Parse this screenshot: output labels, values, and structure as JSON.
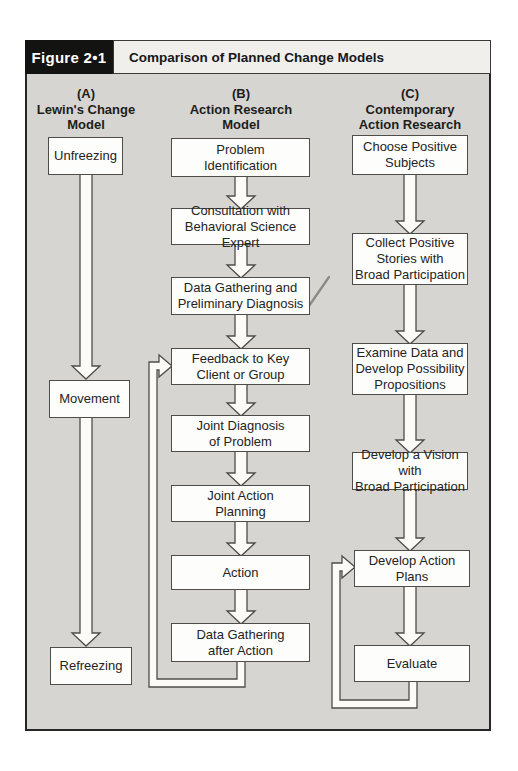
{
  "figure": {
    "label": "Figure 2•1",
    "title": "Comparison of Planned Change Models"
  },
  "columns": {
    "a": {
      "heading": "(A)\nLewin's Change\nModel",
      "boxes": {
        "unfreezing": "Unfreezing",
        "movement": "Movement",
        "refreezing": "Refreezing"
      }
    },
    "b": {
      "heading": "(B)\nAction Research\nModel",
      "boxes": {
        "problem_identification": "Problem\nIdentification",
        "consultation": "Consultation with\nBehavioral Science Expert",
        "data_gathering_preliminary": "Data Gathering and\nPreliminary Diagnosis",
        "feedback_to_key_client": "Feedback to Key\nClient or Group",
        "joint_diagnosis": "Joint Diagnosis\nof Problem",
        "joint_action_planning": "Joint Action\nPlanning",
        "action": "Action",
        "data_gathering_after_action": "Data Gathering\nafter Action"
      }
    },
    "c": {
      "heading": "(C)\nContemporary\nAction Research",
      "boxes": {
        "choose_positive_subjects": "Choose Positive\nSubjects",
        "collect_positive_stories": "Collect Positive\nStories with\nBroad Participation",
        "examine_data": "Examine Data and\nDevelop Possibility\nPropositions",
        "develop_vision": "Develop a Vision with\nBroad Participation",
        "develop_action_plans": "Develop Action\nPlans",
        "evaluate": "Evaluate"
      }
    }
  },
  "colors": {
    "panel_background": "#d6d5d1",
    "panel_border": "#262624",
    "header_label_background": "#131311",
    "header_label_text": "#ffffff",
    "title_background": "#f0efeb",
    "box_background": "#fdfdfb",
    "box_border": "#4f4d4a",
    "text": "#24241f",
    "pencil_annotation": "#8b8a85"
  }
}
